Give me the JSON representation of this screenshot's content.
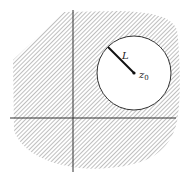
{
  "diagram": {
    "type": "complex-plane-region",
    "colors": {
      "hatch": "#8a8a8a",
      "axis": "#333333",
      "circle": "#333333",
      "radius_line": "#111111",
      "background": "#ffffff"
    },
    "labels": {
      "radius": "L",
      "center_main": "z",
      "center_sub": "0"
    },
    "circle": {
      "cx": 134,
      "cy": 73,
      "r": 37
    },
    "radius_segment": {
      "x1": 108,
      "y1": 47,
      "x2": 134,
      "y2": 73
    },
    "axes": {
      "vertical": {
        "x": 73,
        "y1": 10,
        "y2": 172
      },
      "horizontal": {
        "y": 118,
        "x1": 10,
        "x2": 176
      }
    }
  }
}
